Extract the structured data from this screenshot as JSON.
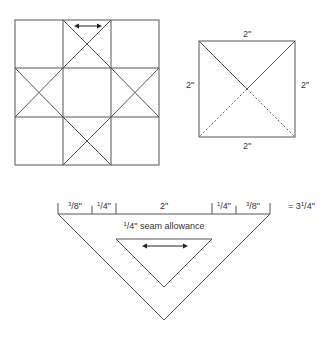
{
  "diagram": {
    "block_grid": {
      "description": "3x3 quilt block, Ohio star style with X-crossed center edge cells",
      "rows": 3,
      "cols": 3,
      "crossed_cells": [
        [
          0,
          1
        ],
        [
          1,
          0
        ],
        [
          1,
          2
        ],
        [
          2,
          1
        ]
      ],
      "grain_arrow": "double-headed arrow in top-middle cell"
    },
    "unit_square": {
      "top_label": "2\"",
      "bottom_label": "2\"",
      "left_label": "2\"",
      "right_label": "2\"",
      "solid_diagonals": "upper half",
      "dashed_diagonals": "lower half"
    },
    "triangle_template": {
      "segments": [
        {
          "num": "3",
          "den": "8",
          "label": "3/8\""
        },
        {
          "num": "1",
          "den": "4",
          "label": "1/4\""
        },
        {
          "whole": "2\"",
          "label": "2\""
        },
        {
          "num": "1",
          "den": "4",
          "label": "1/4\""
        },
        {
          "num": "3",
          "den": "8",
          "label": "3/8\""
        }
      ],
      "total_prefix": "= 3",
      "total_num": "1",
      "total_den": "4",
      "total_label": "= 3 1/4\"",
      "seam_num": "1",
      "seam_text": "/4\" seam allowance",
      "seam_label": "1/4\" seam allowance"
    }
  }
}
